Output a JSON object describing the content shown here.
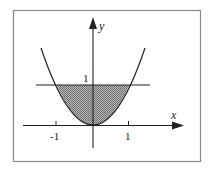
{
  "figure": {
    "axes": {
      "x_label": "x",
      "y_label": "y",
      "x_ticks": [
        {
          "value": -1,
          "label": "-1"
        },
        {
          "value": 1,
          "label": "1"
        }
      ],
      "y_ticks": [
        {
          "value": 1,
          "label": "1"
        }
      ]
    },
    "curves": [
      {
        "name": "parabola",
        "equation": "y = x^2"
      },
      {
        "name": "horizontal-line",
        "equation": "y = 1"
      }
    ],
    "shaded_region": "between y = x^2 and y = 1 for -1 <= x <= 1",
    "colors": {
      "frame": "#888888",
      "stroke": "#222222",
      "shade": "#8a8a8a"
    }
  }
}
